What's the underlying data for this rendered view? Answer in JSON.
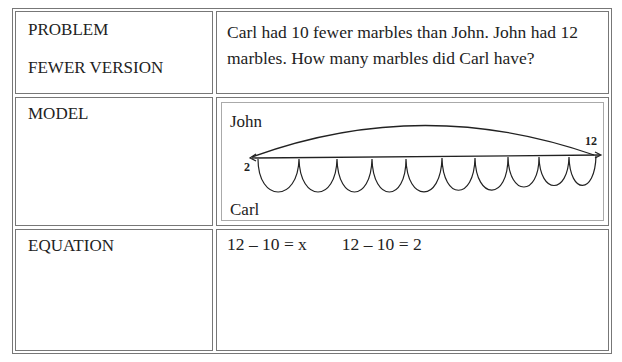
{
  "rows": {
    "problem": {
      "label_1": "PROBLEM",
      "label_2": "FEWER VERSION",
      "text": "Carl had 10 fewer marbles than John. John had 12 marbles. How many marbles did Carl have?"
    },
    "model": {
      "label": "MODEL",
      "diagram": {
        "top_name": "John",
        "bottom_name": "Carl",
        "end_value": "12",
        "start_value": "2",
        "hop_count": 10
      }
    },
    "equation": {
      "label": "EQUATION",
      "text": "12 – 10 = x        12 – 10 = 2"
    }
  }
}
